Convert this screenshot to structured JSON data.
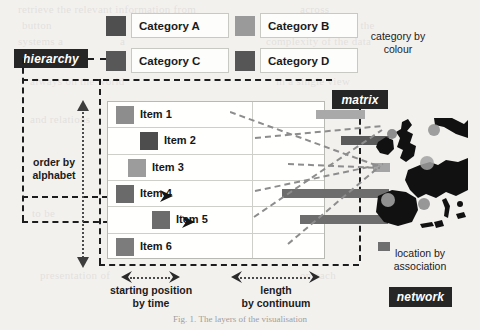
{
  "diagram": {
    "caption": "Fig. 1. The layers of the visualisation"
  },
  "tags": [
    {
      "id": "hierarchy",
      "label": "hierarchy",
      "x": 14,
      "y": 49,
      "w": 74,
      "h": 19,
      "fs": 12
    },
    {
      "id": "matrix",
      "label": "matrix",
      "x": 332,
      "y": 90,
      "w": 56,
      "h": 19,
      "fs": 12
    },
    {
      "id": "network",
      "label": "network",
      "x": 389,
      "y": 287,
      "w": 63,
      "h": 20,
      "fs": 12
    }
  ],
  "legend": {
    "note": "category by\ncolour",
    "note_line1": "category by",
    "note_line2": "colour",
    "items": [
      {
        "label": "Category A",
        "color": "#4f4f4f",
        "sw_x": 106,
        "sw_y": 16,
        "box_x": 131,
        "box_y": 13,
        "box_w": 89,
        "box_h": 23
      },
      {
        "label": "Category B",
        "color": "#9a9a9a",
        "sw_x": 235,
        "sw_y": 16,
        "box_x": 260,
        "box_y": 13,
        "box_w": 89,
        "box_h": 23
      },
      {
        "label": "Category C",
        "color": "#585858",
        "sw_x": 106,
        "sw_y": 51,
        "box_x": 131,
        "box_y": 48,
        "box_w": 89,
        "box_h": 23
      },
      {
        "label": "Category D",
        "color": "#565656",
        "sw_x": 235,
        "sw_y": 51,
        "box_x": 260,
        "box_y": 48,
        "box_w": 89,
        "box_h": 23
      }
    ]
  },
  "matrix": {
    "rows": [
      {
        "label": "Item 1",
        "color": "#8d8d8d",
        "indent": 8,
        "bar_start": 63,
        "bar_width": 49,
        "bar_color": "#a9a9a9",
        "arrow": false
      },
      {
        "label": "Item 2",
        "color": "#4d4d4d",
        "indent": 32,
        "bar_start": 88,
        "bar_width": 48,
        "bar_color": "#5a5a5a",
        "arrow": false
      },
      {
        "label": "Item 3",
        "color": "#9c9c9c",
        "indent": 20,
        "bar_start": 120,
        "bar_width": 17,
        "bar_color": "#a4a4a4",
        "arrow": false
      },
      {
        "label": "Item 4",
        "color": "#6a6a6a",
        "indent": 8,
        "bar_start": 29,
        "bar_width": 107,
        "bar_color": "#6d6d6d",
        "arrow": true
      },
      {
        "label": "Item 5",
        "color": "#6c6c6c",
        "indent": 44,
        "bar_start": 47,
        "bar_width": 88,
        "bar_color": "#6d6d6d",
        "arrow": true
      },
      {
        "label": "Item 6",
        "color": "#7c7c7c",
        "indent": 8,
        "bar_start": 125,
        "bar_width": 12,
        "bar_color": "#6f6f6f",
        "arrow": false
      }
    ]
  },
  "annotations": {
    "order_by": {
      "line1": "order by",
      "line2": "alphabet"
    },
    "starting_position": {
      "line1": "starting position",
      "line2": "by time"
    },
    "length": {
      "line1": "length",
      "line2": "by continuum"
    },
    "location": {
      "line1": "location by",
      "line2": "association"
    }
  },
  "map": {
    "name": "western-europe-map",
    "dots": [
      {
        "x": 62,
        "y": 12,
        "r": 6,
        "color": "#8f8f8f"
      },
      {
        "x": 20,
        "y": 16,
        "r": 5,
        "color": "#7d7d7d"
      },
      {
        "x": 55,
        "y": 45,
        "r": 7,
        "color": "#a2a2a2"
      },
      {
        "x": 52,
        "y": 86,
        "r": 6,
        "color": "#878787"
      },
      {
        "x": 16,
        "y": 82,
        "r": 7,
        "color": "#a8a8a8"
      }
    ]
  },
  "colors": {
    "ink": "#1d1d1d",
    "tag_bg": "#262626",
    "paper": "#f3f1ee",
    "connector": "#8a8a8a"
  },
  "ghost_lines": [
    {
      "t": "retrieve the relevant information from",
      "x": 18,
      "y": 2
    },
    {
      "t": "across",
      "x": 300,
      "y": 2
    },
    {
      "t": "button",
      "x": 22,
      "y": 18
    },
    {
      "t": "the structure of the",
      "x": 286,
      "y": 18
    },
    {
      "t": "systems a",
      "x": 18,
      "y": 34
    },
    {
      "t": "a",
      "x": 120,
      "y": 34
    },
    {
      "t": "complexity of the data",
      "x": 266,
      "y": 34
    },
    {
      "t": "always on the world",
      "x": 30,
      "y": 74
    },
    {
      "t": "in a single view",
      "x": 276,
      "y": 74
    },
    {
      "t": "and relations",
      "x": 30,
      "y": 112
    },
    {
      "t": "multiple",
      "x": 262,
      "y": 138
    },
    {
      "t": "to be",
      "x": 32,
      "y": 206
    },
    {
      "t": "model",
      "x": 284,
      "y": 232
    },
    {
      "t": "presentation of",
      "x": 40,
      "y": 268
    },
    {
      "t": "on each",
      "x": 300,
      "y": 268
    }
  ]
}
